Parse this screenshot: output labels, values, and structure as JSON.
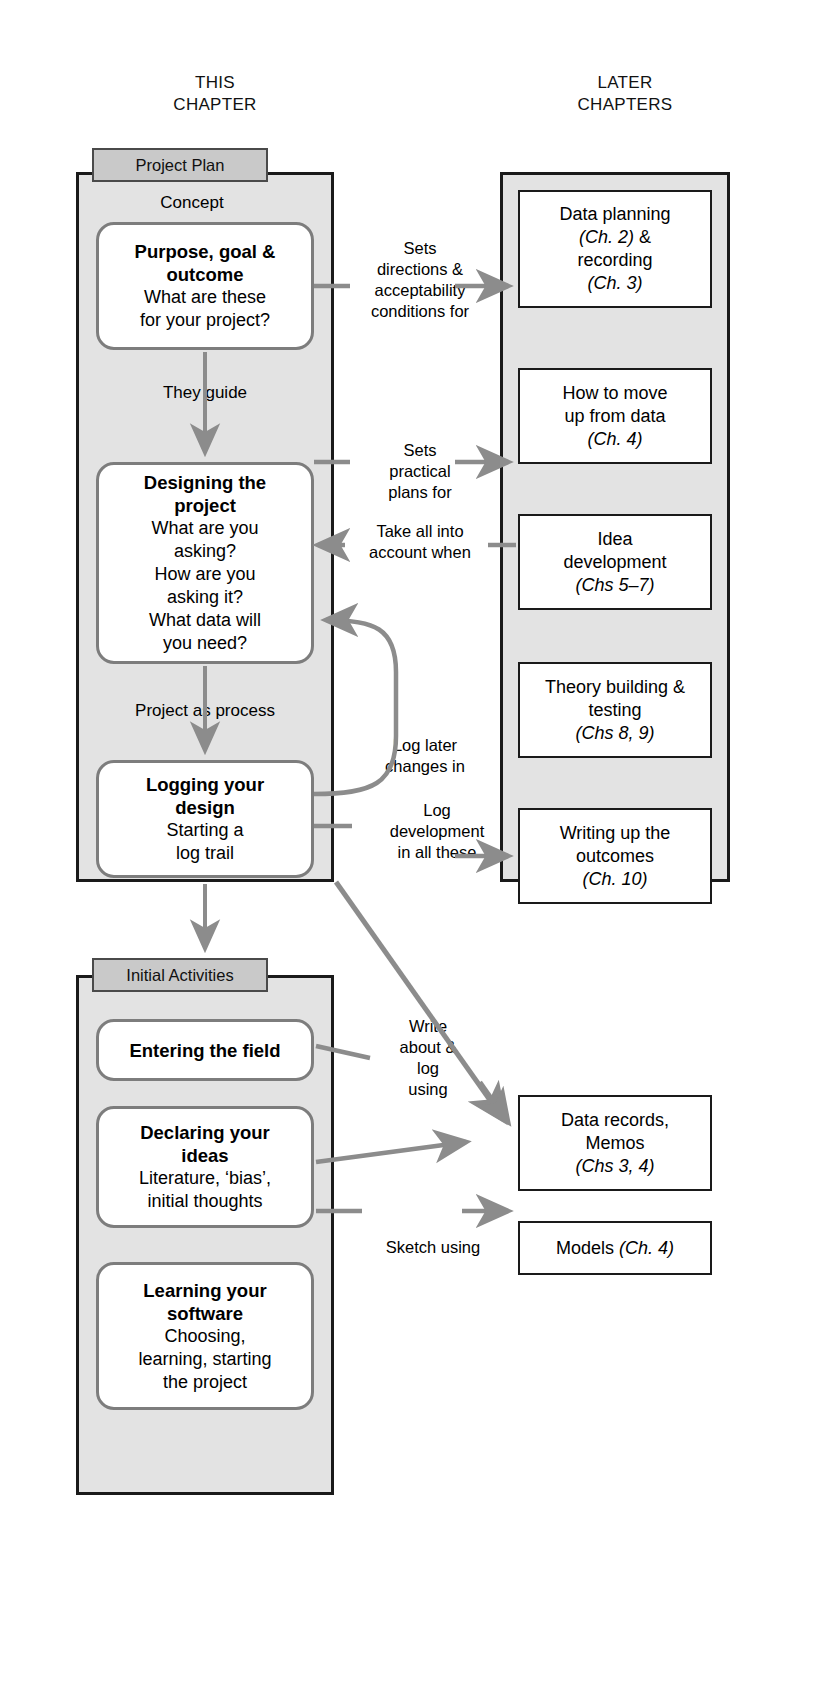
{
  "headers": {
    "left": "THIS\nCHAPTER",
    "left_line1": "THIS",
    "left_line2": "CHAPTER",
    "right_line1": "LATER",
    "right_line2": "CHAPTERS"
  },
  "groups": {
    "project_plan": {
      "tab_label": "Project Plan",
      "caption": "Concept"
    },
    "initial_activities": {
      "tab_label": "Initial Activities"
    }
  },
  "left_boxes": [
    {
      "id": "purpose-goal-outcome",
      "title_line1": "Purpose, goal &",
      "title_line2": "outcome",
      "sub_line1": "What are these",
      "sub_line2": "for your project?"
    },
    {
      "id": "designing-the-project",
      "title_line1": "Designing the",
      "title_line2": "project",
      "sub_line1": "What are you",
      "sub_line2": "asking?",
      "sub_line3": "How are you",
      "sub_line4": "asking it?",
      "sub_line5": "What data will",
      "sub_line6": "you need?"
    },
    {
      "id": "logging-your-design",
      "title_line1": "Logging your",
      "title_line2": "design",
      "sub_line1": "Starting a",
      "sub_line2": "log trail"
    }
  ],
  "bottom_boxes": [
    {
      "id": "entering-the-field",
      "title_line1": "Entering the field"
    },
    {
      "id": "declaring-your-ideas",
      "title_line1": "Declaring your",
      "title_line2": "ideas",
      "sub_line1": "Literature, ‘bias’,",
      "sub_line2": "initial thoughts"
    },
    {
      "id": "learning-your-software",
      "title_line1": "Learning your",
      "title_line2": "software",
      "sub_line1": "Choosing,",
      "sub_line2": "learning, starting",
      "sub_line3": "the project"
    }
  ],
  "right_boxes": [
    {
      "id": "data-planning-recording",
      "line1": "Data planning",
      "line2_ital": "(Ch. 2)",
      "line2_rest": " &",
      "line3": "recording",
      "line4_ital": "(Ch. 3)"
    },
    {
      "id": "how-to-move-up-from-data",
      "line1": "How to move",
      "line2": "up from data",
      "line3_ital": "(Ch. 4)"
    },
    {
      "id": "idea-development",
      "line1": "Idea",
      "line2": "development",
      "line3_ital": "(Chs 5–7)"
    },
    {
      "id": "theory-building-testing",
      "line1": "Theory building &",
      "line2": "testing",
      "line3_ital": "(Chs 8, 9)"
    },
    {
      "id": "writing-up-the-outcomes",
      "line1": "Writing up the",
      "line2": "outcomes",
      "line3_ital": "(Ch. 10)"
    }
  ],
  "outcome_boxes": [
    {
      "id": "data-records-memos",
      "line1": "Data records,",
      "line2": "Memos",
      "line3_ital": "(Chs 3, 4)"
    },
    {
      "id": "models",
      "line1": "Models ",
      "line1_ital": "(Ch. 4)"
    }
  ],
  "flow_labels": {
    "they_guide": "They guide",
    "project_as_process": "Project as process"
  },
  "edge_labels": [
    {
      "id": "sets-directions",
      "line1": "Sets",
      "line2": "directions &",
      "line3": "acceptability",
      "line4": "conditions for"
    },
    {
      "id": "sets-practical-plans",
      "line1": "Sets",
      "line2": "practical",
      "line3": "plans for"
    },
    {
      "id": "take-all-into-account",
      "line1": "Take all into",
      "line2": "account when"
    },
    {
      "id": "log-later-changes",
      "line1": "Log later",
      "line2": "changes in"
    },
    {
      "id": "log-development",
      "line1": "Log",
      "line2": "development",
      "line3": "in all these"
    },
    {
      "id": "write-about-log-using",
      "line1": "Write",
      "line2": "about &",
      "line3": "log",
      "line4": "using"
    },
    {
      "id": "sketch-using",
      "line1": "Sketch using"
    }
  ],
  "colors": {
    "group_fill": "#e3e3e3",
    "group_border": "#1a1a1a",
    "tab_fill": "#c9c9c9",
    "tab_border": "#4a4a4a",
    "round_border": "#7d7d7d",
    "arrow": "#8c8c8c",
    "box_border": "#1a1a1a",
    "page_bg": "#ffffff"
  }
}
